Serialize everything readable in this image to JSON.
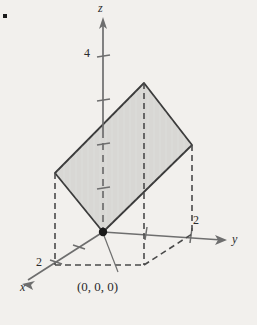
{
  "figure": {
    "background_color": "#f2f0ed",
    "bullet": {
      "name": "list-bullet",
      "x": 3,
      "y": 14,
      "size": 4,
      "color": "#1a1a1a"
    }
  },
  "axes": {
    "origin": {
      "x": 103,
      "y": 232
    },
    "z": {
      "label": "z",
      "label_pos": {
        "x": 99,
        "y": 4
      },
      "solid_from": {
        "x": 103,
        "y": 20
      },
      "solid_to": {
        "x": 103,
        "y": 131
      },
      "dashed_from": {
        "x": 103,
        "y": 131
      },
      "dashed_to": {
        "x": 103,
        "y": 232
      },
      "arrow_tip": {
        "x": 103,
        "y": 18
      },
      "ticks": [
        {
          "value": "4",
          "x": 103,
          "y": 57
        },
        {
          "value": "3",
          "x": 103,
          "y": 101
        },
        {
          "value": "2",
          "x": 103,
          "y": 145
        },
        {
          "value": "1",
          "x": 103,
          "y": 189
        }
      ],
      "tick_labels": [
        {
          "text": "4",
          "x": 84,
          "y": 48
        }
      ]
    },
    "y": {
      "label": "y",
      "label_pos": {
        "x": 232,
        "y": 233
      },
      "from": {
        "x": 103,
        "y": 232
      },
      "to": {
        "x": 224,
        "y": 240
      },
      "arrow_tip": {
        "x": 226,
        "y": 240
      },
      "ticks": [
        {
          "value": "1",
          "x": 147,
          "y": 235
        },
        {
          "value": "2",
          "x": 191,
          "y": 238
        }
      ],
      "tick_labels": [
        {
          "text": "2",
          "x": 192,
          "y": 215
        }
      ]
    },
    "x": {
      "label": "x",
      "label_pos": {
        "x": 20,
        "y": 281
      },
      "from": {
        "x": 103,
        "y": 232
      },
      "to": {
        "x": 26,
        "y": 282
      },
      "arrow_tip": {
        "x": 23,
        "y": 284
      },
      "ticks": [
        {
          "value": "1",
          "x": 79,
          "y": 248
        },
        {
          "value": "2",
          "x": 56,
          "y": 263
        }
      ],
      "tick_labels": [
        {
          "text": "2",
          "x": 36,
          "y": 258
        }
      ]
    }
  },
  "surface": {
    "name": "shaded-parallelogram",
    "fill_color": "#d8d7d4",
    "stroke_color": "#3a3a3a",
    "stroke_width": 1.8,
    "vertices": [
      {
        "name": "origin-corner",
        "x": 103,
        "y": 232
      },
      {
        "name": "x-corner",
        "x": 55,
        "y": 173
      },
      {
        "name": "top-corner",
        "x": 144,
        "y": 83
      },
      {
        "name": "y-corner",
        "x": 192,
        "y": 145
      }
    ]
  },
  "projection": {
    "dash_color": "#4a4a4a",
    "dash_width": 1.6,
    "dash_pattern": "6,4",
    "drop_lines": [
      {
        "name": "drop-line-x-corner",
        "from": {
          "x": 55,
          "y": 173
        },
        "to": {
          "x": 55,
          "y": 264
        }
      },
      {
        "name": "drop-line-top-corner",
        "from": {
          "x": 144,
          "y": 83
        },
        "to": {
          "x": 144,
          "y": 264
        }
      },
      {
        "name": "drop-line-y-corner",
        "from": {
          "x": 192,
          "y": 145
        },
        "to": {
          "x": 192,
          "y": 233
        }
      }
    ],
    "base_outline": [
      {
        "name": "base-edge-x-to-far",
        "from": {
          "x": 55,
          "y": 264
        },
        "to": {
          "x": 144,
          "y": 264
        }
      },
      {
        "name": "base-edge-far-to-y",
        "from": {
          "x": 144,
          "y": 264
        },
        "to": {
          "x": 192,
          "y": 233
        }
      }
    ]
  },
  "origin_marker": {
    "name": "origin-point",
    "x": 103,
    "y": 232,
    "radius": 4,
    "color": "#1a1a1a",
    "label": "(0, 0, 0)",
    "label_pos": {
      "x": 78,
      "y": 281
    },
    "leader_from": {
      "x": 103,
      "y": 232
    },
    "leader_to": {
      "x": 118,
      "y": 275
    }
  },
  "chart_data": {
    "type": "scatter",
    "xlabel": "x",
    "ylabel": "y",
    "zlabel": "z",
    "annotations": [
      "(0, 0, 0)"
    ],
    "tick_values": {
      "x": [
        2
      ],
      "y": [
        2
      ],
      "z": [
        4
      ]
    },
    "surface_corners_3d": [
      {
        "x": 0,
        "y": 0,
        "z": 0
      },
      {
        "x": 2,
        "y": 0,
        "z": 2
      },
      {
        "x": 2,
        "y": 2,
        "z": 4
      },
      {
        "x": 0,
        "y": 2,
        "z": 2
      }
    ],
    "grid": false,
    "legend": "none"
  }
}
